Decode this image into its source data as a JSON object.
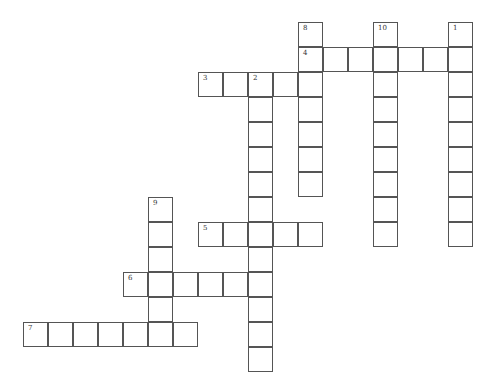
{
  "puzzle": {
    "origin": {
      "x": 23,
      "y": 22
    },
    "cell_size": 25,
    "border_color": "#555555",
    "words": [
      {
        "number": "1",
        "direction": "down",
        "row": 0,
        "col": 17,
        "length": 9
      },
      {
        "number": "2",
        "direction": "down",
        "row": 2,
        "col": 9,
        "length": 12
      },
      {
        "number": "3",
        "direction": "across",
        "row": 2,
        "col": 7,
        "length": 5
      },
      {
        "number": "4",
        "direction": "across",
        "row": 1,
        "col": 11,
        "length": 7
      },
      {
        "number": "5",
        "direction": "across",
        "row": 8,
        "col": 7,
        "length": 5
      },
      {
        "number": "6",
        "direction": "across",
        "row": 10,
        "col": 4,
        "length": 6
      },
      {
        "number": "7",
        "direction": "across",
        "row": 12,
        "col": 0,
        "length": 7
      },
      {
        "number": "8",
        "direction": "down",
        "row": 0,
        "col": 11,
        "length": 7
      },
      {
        "number": "9",
        "direction": "down",
        "row": 7,
        "col": 5,
        "length": 6
      },
      {
        "number": "10",
        "direction": "down",
        "row": 0,
        "col": 14,
        "length": 9
      }
    ]
  }
}
